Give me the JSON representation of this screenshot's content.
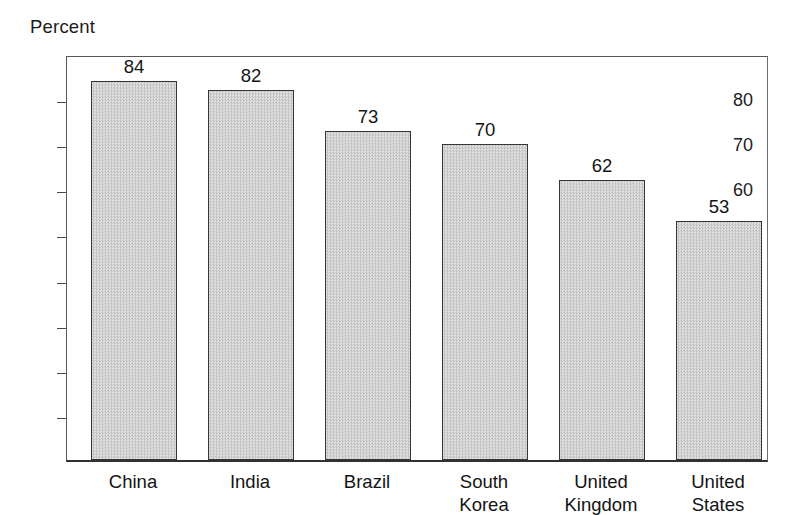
{
  "chart_data": {
    "type": "bar",
    "title": "",
    "subtitle": "",
    "xlabel": "",
    "ylabel": "Percent",
    "categories": [
      "China",
      "India",
      "Brazil",
      "South\nKorea",
      "United\nKingdom",
      "United\nStates"
    ],
    "values": [
      84,
      82,
      73,
      70,
      62,
      53
    ],
    "value_labels": [
      "84",
      "82",
      "73",
      "70",
      "62",
      "53"
    ],
    "ylim": [
      0,
      90
    ],
    "yticks": [
      80,
      70,
      60,
      50,
      40,
      30,
      20,
      10
    ],
    "ytick_labels": [
      "80",
      "70",
      "60",
      "50",
      "40",
      "30",
      "20",
      "10"
    ],
    "grid": false,
    "legend": null,
    "legend_position": "none",
    "annotations": [],
    "bar_fill_color": "#d3d3d3",
    "bar_edge_color": "#333537",
    "frame_color": "#55585c",
    "text_color": "#1a1a1a"
  },
  "axis": {
    "y_title": "Percent"
  }
}
